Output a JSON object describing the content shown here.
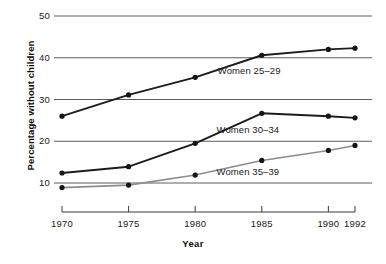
{
  "chart_data": {
    "type": "line",
    "title": "",
    "xlabel": "Year",
    "ylabel": "Percentage without children",
    "x": [
      1970,
      1975,
      1980,
      1985,
      1990,
      1992
    ],
    "xtick_labels": [
      "1970",
      "1975",
      "1980",
      "1985",
      "1990",
      "1992"
    ],
    "ytick_labels": [
      "10",
      "20",
      "30",
      "40",
      "50"
    ],
    "yticks": [
      10,
      20,
      30,
      40,
      50
    ],
    "xlim": [
      1968.5,
      1993.2
    ],
    "ylim": [
      7.5,
      51.5
    ],
    "grid": "horizontal",
    "legend_position": "inline-annotations",
    "series": [
      {
        "name": "Women 25–29",
        "label": "Women 25–29",
        "color": "#1c1c1c",
        "values": [
          26.0,
          31.1,
          35.3,
          40.6,
          42.0,
          42.3
        ]
      },
      {
        "name": "Women 30–34",
        "label": "Women 30–34",
        "color": "#1c1c1c",
        "values": [
          12.4,
          13.9,
          19.5,
          26.7,
          26.0,
          25.6
        ]
      },
      {
        "name": "Women 35–39",
        "label": "Women 35–39",
        "color": "#8c8c8c",
        "values": [
          8.9,
          9.5,
          11.9,
          15.4,
          17.8,
          19.0
        ]
      }
    ],
    "annotations": [
      {
        "text": "Women 25–29",
        "x": 1981.7,
        "y": 36.8
      },
      {
        "text": "Women 30–34",
        "x": 1981.6,
        "y": 22.6
      },
      {
        "text": "Women 35–39",
        "x": 1981.6,
        "y": 12.6
      }
    ]
  }
}
